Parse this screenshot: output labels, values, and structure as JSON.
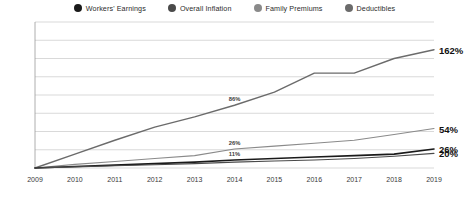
{
  "legend": {
    "items": [
      {
        "label": "Workers' Earnings",
        "color": "#1a1a1a",
        "icon": "legend-dot-icon"
      },
      {
        "label": "Overall Inflation",
        "color": "#4a4a4a",
        "icon": "legend-dot-icon"
      },
      {
        "label": "Family Premiums",
        "color": "#8a8a8a",
        "icon": "legend-dot-icon"
      },
      {
        "label": "Deductibles",
        "color": "#6b6b6b",
        "icon": "legend-dot-icon"
      }
    ]
  },
  "chart_data": {
    "type": "line",
    "title": "",
    "xlabel": "",
    "ylabel": "",
    "grid": true,
    "legend_position": "top-center",
    "x": [
      2009,
      2010,
      2011,
      2012,
      2013,
      2014,
      2015,
      2016,
      2017,
      2018,
      2019
    ],
    "categories": [
      "2009",
      "2010",
      "2011",
      "2012",
      "2013",
      "2014",
      "2015",
      "2016",
      "2017",
      "2018",
      "2019"
    ],
    "xlim": [
      2009,
      2019
    ],
    "ylim": [
      0,
      200
    ],
    "yticks": [
      0,
      25,
      50,
      75,
      100,
      125,
      150,
      175,
      200
    ],
    "ytick_labels": [
      "0%",
      "25%",
      "50%",
      "75%",
      "100%",
      "125%",
      "150%",
      "175%",
      "200%"
    ],
    "series": [
      {
        "name": "Deductibles",
        "color": "#6b6b6b",
        "width": 1.4,
        "values": [
          0,
          19,
          38,
          56,
          70,
          86,
          104,
          130,
          130,
          150,
          162
        ],
        "end_label": "162%",
        "mid_label": {
          "text": "86%",
          "x": 2014,
          "y": 86
        }
      },
      {
        "name": "Family Premiums",
        "color": "#8a8a8a",
        "width": 1.1,
        "values": [
          0,
          5,
          9,
          13,
          17,
          26,
          30,
          34,
          38,
          46,
          54
        ],
        "end_label": "54%",
        "mid_label": {
          "text": "26%",
          "x": 2014,
          "y": 26
        }
      },
      {
        "name": "Workers' Earnings",
        "color": "#1a1a1a",
        "width": 1.6,
        "values": [
          0,
          2,
          4,
          6,
          8,
          11,
          13,
          15,
          17,
          19,
          26
        ],
        "end_label": "26%",
        "mid_label": {
          "text": "11%",
          "x": 2014,
          "y": 11
        }
      },
      {
        "name": "Overall Inflation",
        "color": "#4a4a4a",
        "width": 1.1,
        "values": [
          0,
          1.5,
          3,
          4.5,
          6,
          8,
          9.5,
          11,
          13,
          16,
          20
        ],
        "end_label": "20%",
        "mid_label": null
      }
    ]
  },
  "colors": {
    "grid": "#c9c9c9",
    "axis": "#9a9a9a",
    "background": "#ffffff",
    "label_text": "#3a3a3a",
    "end_label_text": "#111111"
  }
}
